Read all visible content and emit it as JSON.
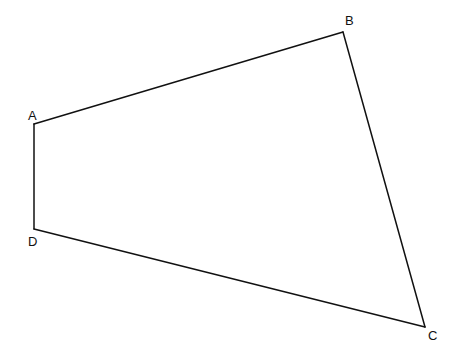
{
  "diagram": {
    "type": "quadrilateral",
    "vertices": [
      {
        "id": "A",
        "label": "A"
      },
      {
        "id": "B",
        "label": "B"
      },
      {
        "id": "C",
        "label": "C"
      },
      {
        "id": "D",
        "label": "D"
      }
    ],
    "edges": [
      {
        "name": "AB",
        "from": "A",
        "to": "B"
      },
      {
        "name": "BC",
        "from": "B",
        "to": "C"
      },
      {
        "name": "CD",
        "from": "C",
        "to": "D"
      },
      {
        "name": "DA",
        "from": "D",
        "to": "A"
      }
    ],
    "colors": {
      "stroke": "#111111",
      "background": "#ffffff"
    }
  }
}
